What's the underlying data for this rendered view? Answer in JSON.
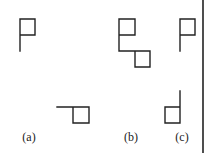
{
  "figure": {
    "panels": [
      {
        "id": "a",
        "label": "(a)",
        "label_pos": [
          29,
          141
        ],
        "shapes": [
          {
            "name": "flag-top-a",
            "path": "M20 51 L20 19 L35 19 L35 35 L20 35"
          },
          {
            "name": "flag-bottom-a",
            "path": "M57 107 L73 107 L73 123 L89 123 L89 107 L73 107"
          }
        ]
      },
      {
        "id": "b",
        "label": "(b)",
        "label_pos": [
          131,
          141
        ],
        "shapes": [
          {
            "name": "flag-b",
            "path": "M119 51 L119 19 L135 19 L135 35 L119 35 M119 51 L135 51 L135 67 L150 67 L150 51 L135 51"
          }
        ]
      },
      {
        "id": "c",
        "label": "(c)",
        "label_pos": [
          182,
          141
        ],
        "shapes": [
          {
            "name": "flag-top-c",
            "path": "M180 51 L180 19 L195 19 L195 35 L180 35"
          },
          {
            "name": "flag-bottom-c",
            "path": "M180 91 L180 123 L165 123 L165 107 L180 107"
          }
        ]
      }
    ],
    "border": {
      "x": 203,
      "y1": 0,
      "y2": 153
    },
    "stroke_color": "#222222",
    "background": "#ffffff"
  }
}
